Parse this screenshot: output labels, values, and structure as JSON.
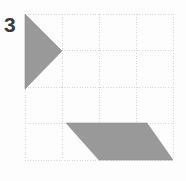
{
  "figure": {
    "label": "3",
    "label_color": "#3a3a3a",
    "background_color": "#fdfdfd"
  },
  "grid": {
    "x0": 25,
    "y0": 14,
    "x1": 173,
    "y1": 160,
    "columns": 4,
    "rows": 4,
    "cell_width": 37,
    "cell_height": 36.5,
    "line_color": "#d8d8d8",
    "line_style": "dotted",
    "line_width": 1
  },
  "shapes": {
    "fill_color": "#999999",
    "stroke_color": "#8f8f8f",
    "items": [
      {
        "name": "right-pointing-triangle",
        "type": "triangle",
        "points": "25,14 62,51 25,89"
      },
      {
        "name": "parallelogram",
        "type": "parallelogram",
        "points": "66,123 147,123 173,160 99,160"
      }
    ]
  }
}
